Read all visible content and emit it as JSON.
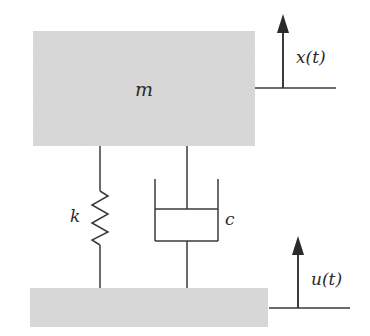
{
  "diagram": {
    "colors": {
      "block_fill": "#d4d4d4",
      "line": "#3a3a3a",
      "text": "#2a2a2a"
    },
    "mass": {
      "label": "m"
    },
    "spring": {
      "label": "k"
    },
    "damper": {
      "label": "c"
    },
    "mass_displacement": {
      "label": "x(t)"
    },
    "base_displacement": {
      "label": "u(t)"
    }
  }
}
